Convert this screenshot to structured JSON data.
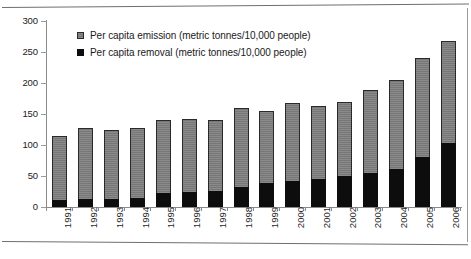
{
  "chart_data": {
    "type": "bar",
    "stacked": true,
    "title": "",
    "xlabel": "",
    "ylabel": "",
    "ylim": [
      0,
      300
    ],
    "ytick_step": 50,
    "yticks": [
      0,
      50,
      100,
      150,
      200,
      250,
      300
    ],
    "grid": false,
    "legend_position": "top-left-inside",
    "categories": [
      "1991",
      "1992",
      "1993",
      "1994",
      "1995",
      "1996",
      "1997",
      "1998",
      "1999",
      "2000",
      "2001",
      "2002",
      "2003",
      "2004",
      "2005",
      "2006"
    ],
    "series": [
      {
        "name": "Per capita emission (metric tonnes/10,000 people)",
        "color": "#7d7d7d",
        "note": "values are the total bar height (top of stack)",
        "values": [
          115,
          128,
          125,
          128,
          140,
          142,
          141,
          160,
          155,
          167,
          163,
          170,
          188,
          205,
          240,
          268
        ]
      },
      {
        "name": "Per capita removal (metric tonnes/10,000 people)",
        "color": "#0d0d0d",
        "note": "black lower segment of each stacked bar",
        "values": [
          12,
          13,
          13,
          14,
          22,
          25,
          26,
          32,
          38,
          42,
          45,
          50,
          55,
          62,
          80,
          103
        ]
      }
    ]
  },
  "legend": {
    "items": [
      {
        "label": "Per capita emission (metric tonnes/10,000 people)",
        "swatch": "emission"
      },
      {
        "label": "Per capita removal (metric tonnes/10,000 people)",
        "swatch": "removal"
      }
    ]
  }
}
